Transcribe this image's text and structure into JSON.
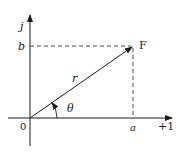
{
  "diagram": {
    "type": "complex-plane-phasor",
    "axes": {
      "vertical_label": "j",
      "horizontal_label": "+1",
      "origin_label": "0"
    },
    "point": {
      "label": "F"
    },
    "vector": {
      "magnitude_label": "r"
    },
    "angle": {
      "label": "θ"
    },
    "projections": {
      "real_label": "a",
      "imag_label": "b"
    },
    "colors": {
      "ink": "#1a1a1a",
      "background": "#ffffff"
    }
  }
}
